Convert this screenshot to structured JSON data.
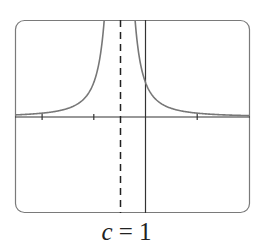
{
  "chart_data": {
    "type": "line",
    "title": "",
    "caption": {
      "variable": "c",
      "equals": " = ",
      "value": "1"
    },
    "xlabel": "",
    "ylabel": "",
    "grid": false,
    "legend": null,
    "xlim": [
      -3.5,
      2.0
    ],
    "ylim": [
      -3.0,
      3.0
    ],
    "x_ticks": [
      -3,
      -2,
      -1,
      1
    ],
    "vertical_asymptote": {
      "x": -0.5,
      "style": "dashed"
    },
    "horizontal_asymptote": {
      "y": 0
    },
    "series": [
      {
        "name": "f(x), left branch",
        "x": [
          -3.5,
          -3.0,
          -2.5,
          -2.0,
          -1.5,
          -1.25,
          -1.0,
          -0.9,
          -0.8,
          -0.75
        ],
        "y": [
          0.07,
          0.11,
          0.18,
          0.3,
          0.7,
          1.2,
          2.0,
          2.6,
          3.0,
          3.0
        ]
      },
      {
        "name": "f(x), right branch",
        "x": [
          -0.3,
          -0.2,
          -0.1,
          0.0,
          0.25,
          0.5,
          1.0,
          1.5,
          2.0
        ],
        "y": [
          3.0,
          3.0,
          2.5,
          1.9,
          1.0,
          0.6,
          0.27,
          0.14,
          0.07
        ]
      }
    ]
  },
  "colors": {
    "frame": "#7a7a7a",
    "axes": "#333333",
    "curve": "#777777",
    "asymptote": "#222222"
  }
}
